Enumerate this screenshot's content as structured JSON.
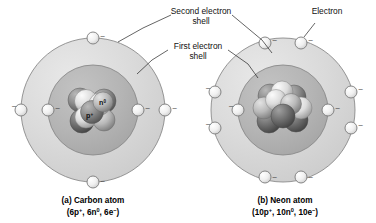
{
  "figure": {
    "background_color": "#ffffff",
    "callouts": [
      {
        "id": "second-shell",
        "line1": "Second electron",
        "line2": "shell"
      },
      {
        "id": "first-shell",
        "line1": "First electron",
        "line2": "shell"
      },
      {
        "id": "electron",
        "line1": "Electron",
        "line2": ""
      }
    ],
    "colors": {
      "outer_shell_fill": "#d9d9d9",
      "inner_shell_fill": "#b5b5b5",
      "shell_stroke": "#8a8a8a",
      "electron_fill": "#f2f2f2",
      "electron_stroke": "#7a7a7a",
      "leader_line": "#222222",
      "text": "#111111"
    },
    "atoms": [
      {
        "id": "carbon",
        "caption_line1": "(a) Carbon atom",
        "caption_line2_prefix": "(6p",
        "caption_parts": [
          "6p",
          "+",
          ", 6n",
          "0",
          ", 6e",
          "−",
          ")"
        ],
        "caption_line2": "(6p+, 6n0, 6e−)",
        "protons": 6,
        "protons_label": "6p",
        "neutrons": 6,
        "neutrons_label": "6n",
        "electrons": 6,
        "electrons_label": "6e",
        "inner_shell_electrons": 2,
        "outer_shell_electrons": 4,
        "nucleus_labels": [
          {
            "id": "neutron-label",
            "symbol": "n",
            "charge": "0"
          },
          {
            "id": "proton-label",
            "symbol": "p",
            "charge": "+"
          }
        ]
      },
      {
        "id": "neon",
        "caption_line1": "(b) Neon atom",
        "caption_parts": [
          "10p",
          "+",
          ", 10n",
          "0",
          ", 10e",
          "−",
          ")"
        ],
        "caption_line2": "(10p+, 10n0, 10e−)",
        "protons": 10,
        "protons_label": "10p",
        "neutrons": 10,
        "neutrons_label": "10n",
        "electrons": 10,
        "electrons_label": "10e",
        "inner_shell_electrons": 2,
        "outer_shell_electrons": 8,
        "nucleus_labels": []
      }
    ],
    "electron_charge_glyph": "–"
  }
}
